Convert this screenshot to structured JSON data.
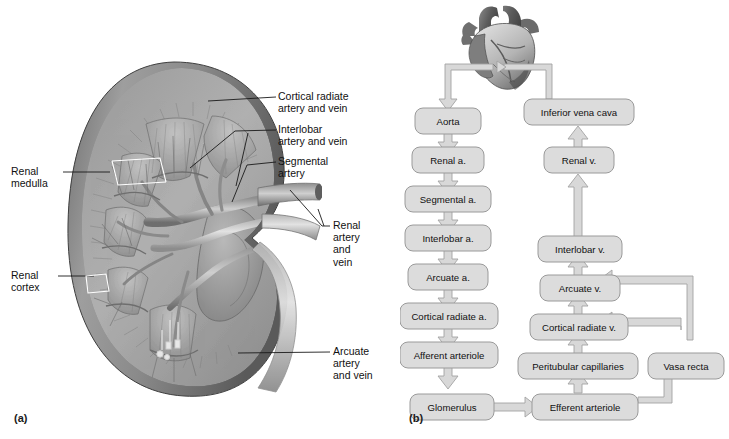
{
  "figure": {
    "panel_a_letter": "(a)",
    "panel_b_letter": "(b)"
  },
  "kidney": {
    "title": "Frontal section of kidney showing blood supply",
    "callouts": [
      {
        "id": "cortical-radiate",
        "lines": [
          "Cortical radiate",
          "artery and vein"
        ]
      },
      {
        "id": "interlobar",
        "lines": [
          "Interlobar",
          "artery and vein"
        ]
      },
      {
        "id": "segmental",
        "lines": [
          "Segmental",
          "artery"
        ]
      },
      {
        "id": "renal-artery-vein",
        "lines": [
          "Renal",
          "artery",
          "and",
          "vein"
        ]
      },
      {
        "id": "arcuate",
        "lines": [
          "Arcuate",
          "artery",
          "and vein"
        ]
      },
      {
        "id": "renal-medulla",
        "lines": [
          "Renal",
          "medulla"
        ]
      },
      {
        "id": "renal-cortex",
        "lines": [
          "Renal",
          "cortex"
        ]
      }
    ]
  },
  "flowchart": {
    "type": "flow",
    "organ_label": "heart",
    "arterial_series": [
      "Aorta",
      "Renal a.",
      "Segmental a.",
      "Interlobar a.",
      "Arcuate a.",
      "Cortical radiate a.",
      "Afferent arteriole",
      "Glomerulus"
    ],
    "venous_series": [
      "Inferior vena cava",
      "Renal v.",
      "Interlobar v.",
      "Arcuate v.",
      "Cortical radiate v.",
      "Peritubular capillaries",
      "Efferent arteriole"
    ],
    "side_series": [
      "Vasa recta"
    ],
    "colors": {
      "node_fill": "#dcdcdc",
      "node_stroke": "#9a9a9a",
      "arrow_fill": "#d8d8d8",
      "arrow_stroke": "#a3a3a3"
    }
  }
}
